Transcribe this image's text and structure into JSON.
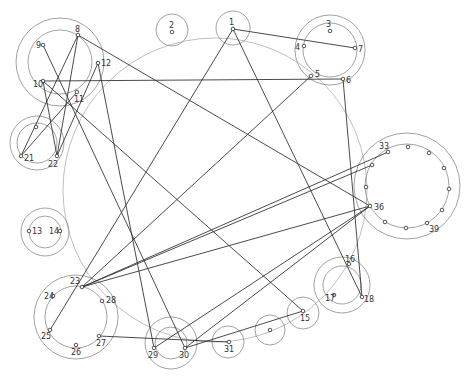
{
  "diagram": {
    "title": "",
    "big_circle": {
      "cx": 215,
      "cy": 190,
      "r": 152
    },
    "clusters": [
      {
        "id": "c-8-12",
        "cx": 60,
        "cy": 62,
        "r_outer": 44,
        "r_inner": 32
      },
      {
        "id": "c-2",
        "cx": 172,
        "cy": 30,
        "r_outer": 16,
        "r_inner": 0
      },
      {
        "id": "c-1",
        "cx": 233,
        "cy": 28,
        "r_outer": 17,
        "r_inner": 0
      },
      {
        "id": "c-3-7",
        "cx": 330,
        "cy": 50,
        "r_outer": 35,
        "r_inner": 27
      },
      {
        "id": "c-21-22",
        "cx": 37,
        "cy": 143,
        "r_outer": 27,
        "r_inner": 20
      },
      {
        "id": "c-33-44",
        "cx": 407,
        "cy": 186,
        "r_outer": 53,
        "r_inner": 42
      },
      {
        "id": "c-13-14",
        "cx": 45,
        "cy": 232,
        "r_outer": 24,
        "r_inner": 16
      },
      {
        "id": "c-16-18",
        "cx": 342,
        "cy": 285,
        "r_outer": 28,
        "r_inner": 19
      },
      {
        "id": "c-23-28",
        "cx": 76,
        "cy": 317,
        "r_outer": 42,
        "r_inner": 31
      },
      {
        "id": "c-15",
        "cx": 303,
        "cy": 313,
        "r_outer": 16,
        "r_inner": 0
      },
      {
        "id": "c-unl",
        "cx": 270,
        "cy": 330,
        "r_outer": 15,
        "r_inner": 0
      },
      {
        "id": "c-31",
        "cx": 228,
        "cy": 342,
        "r_outer": 16,
        "r_inner": 0
      },
      {
        "id": "c-29-30",
        "cx": 171,
        "cy": 343,
        "r_outer": 26,
        "r_inner": 16
      }
    ],
    "nodes": [
      {
        "id": "1",
        "x": 233,
        "y": 29,
        "label": "1",
        "lx": 229,
        "ly": 25
      },
      {
        "id": "2",
        "x": 172,
        "y": 32,
        "label": "2",
        "lx": 169,
        "ly": 28
      },
      {
        "id": "3",
        "x": 330,
        "y": 31,
        "label": "3",
        "lx": 326,
        "ly": 27
      },
      {
        "id": "4",
        "x": 304,
        "y": 46,
        "label": "4",
        "lx": 295,
        "ly": 50
      },
      {
        "id": "5",
        "x": 311,
        "y": 76,
        "label": "5",
        "lx": 315,
        "ly": 77
      },
      {
        "id": "6",
        "x": 343,
        "y": 79,
        "label": "6",
        "lx": 346,
        "ly": 83
      },
      {
        "id": "7",
        "x": 355,
        "y": 48,
        "label": "7",
        "lx": 358,
        "ly": 52
      },
      {
        "id": "8",
        "x": 78,
        "y": 35,
        "label": "8",
        "lx": 75,
        "ly": 32
      },
      {
        "id": "9",
        "x": 43,
        "y": 45,
        "label": "9",
        "lx": 36,
        "ly": 48
      },
      {
        "id": "10",
        "x": 43,
        "y": 81,
        "label": "10",
        "lx": 33,
        "ly": 87
      },
      {
        "id": "11",
        "x": 77,
        "y": 92,
        "label": "11",
        "lx": 74,
        "ly": 102
      },
      {
        "id": "12",
        "x": 98,
        "y": 63,
        "label": "12",
        "lx": 101,
        "ly": 66
      },
      {
        "id": "13",
        "x": 29,
        "y": 231,
        "label": "13",
        "lx": 32,
        "ly": 234
      },
      {
        "id": "14",
        "x": 60,
        "y": 231,
        "label": "14",
        "lx": 49,
        "ly": 234
      },
      {
        "id": "15",
        "x": 303,
        "y": 311,
        "label": "15",
        "lx": 300,
        "ly": 321
      },
      {
        "id": "16",
        "x": 349,
        "y": 264,
        "label": "16",
        "lx": 345,
        "ly": 262
      },
      {
        "id": "17",
        "x": 334,
        "y": 295,
        "label": "17",
        "lx": 325,
        "ly": 301
      },
      {
        "id": "18",
        "x": 362,
        "y": 297,
        "label": "18",
        "lx": 364,
        "ly": 302
      },
      {
        "id": "21",
        "x": 21,
        "y": 156,
        "label": "21",
        "lx": 24,
        "ly": 161
      },
      {
        "id": "22",
        "x": 57,
        "y": 156,
        "label": "22",
        "lx": 48,
        "ly": 167
      },
      {
        "id": "23",
        "x": 82,
        "y": 287,
        "label": "23",
        "lx": 70,
        "ly": 284
      },
      {
        "id": "24",
        "x": 53,
        "y": 296,
        "label": "24",
        "lx": 44,
        "ly": 299
      },
      {
        "id": "25",
        "x": 50,
        "y": 330,
        "label": "25",
        "lx": 41,
        "ly": 339
      },
      {
        "id": "26",
        "x": 76,
        "y": 345,
        "label": "26",
        "lx": 71,
        "ly": 355
      },
      {
        "id": "27",
        "x": 99,
        "y": 336,
        "label": "27",
        "lx": 96,
        "ly": 346
      },
      {
        "id": "28",
        "x": 102,
        "y": 301,
        "label": "28",
        "lx": 106,
        "ly": 303
      },
      {
        "id": "29",
        "x": 154,
        "y": 348,
        "label": "29",
        "lx": 148,
        "ly": 358
      },
      {
        "id": "30",
        "x": 185,
        "y": 348,
        "label": "30",
        "lx": 179,
        "ly": 358
      },
      {
        "id": "31",
        "x": 229,
        "y": 342,
        "label": "31",
        "lx": 224,
        "ly": 352
      },
      {
        "id": "32",
        "x": 270,
        "y": 330,
        "label": "",
        "lx": 0,
        "ly": 0
      },
      {
        "id": "33",
        "x": 388,
        "y": 152,
        "label": "33",
        "lx": 379,
        "ly": 149
      },
      {
        "id": "34",
        "x": 408,
        "y": 147,
        "label": "",
        "lx": 0,
        "ly": 0
      },
      {
        "id": "35",
        "x": 429,
        "y": 153,
        "label": "",
        "lx": 0,
        "ly": 0
      },
      {
        "id": "36",
        "x": 444,
        "y": 168,
        "label": "",
        "lx": 0,
        "ly": 0
      },
      {
        "id": "37",
        "x": 449,
        "y": 189,
        "label": "",
        "lx": 0,
        "ly": 0
      },
      {
        "id": "38",
        "x": 442,
        "y": 210,
        "label": "",
        "lx": 0,
        "ly": 0
      },
      {
        "id": "39",
        "x": 427,
        "y": 223,
        "label": "39",
        "lx": 429,
        "ly": 232
      },
      {
        "id": "40",
        "x": 406,
        "y": 228,
        "label": "",
        "lx": 0,
        "ly": 0
      },
      {
        "id": "41",
        "x": 385,
        "y": 222,
        "label": "",
        "lx": 0,
        "ly": 0
      },
      {
        "id": "42",
        "x": 370,
        "y": 206,
        "label": "36",
        "lx": 374,
        "ly": 210
      },
      {
        "id": "43",
        "x": 366,
        "y": 187,
        "label": "",
        "lx": 0,
        "ly": 0
      },
      {
        "id": "44",
        "x": 372,
        "y": 165,
        "label": "",
        "lx": 0,
        "ly": 0
      },
      {
        "id": "45",
        "x": 36,
        "y": 127,
        "label": "",
        "lx": 0,
        "ly": 0
      }
    ],
    "edges": [
      {
        "from": "1",
        "to": "7"
      },
      {
        "from": "1",
        "to": "18"
      },
      {
        "from": "1",
        "to": "25"
      },
      {
        "from": "6",
        "to": "18"
      },
      {
        "from": "10",
        "to": "6"
      },
      {
        "from": "5",
        "to": "23"
      },
      {
        "from": "8",
        "to": "21"
      },
      {
        "from": "8",
        "to": "22"
      },
      {
        "from": "8",
        "to": "42"
      },
      {
        "from": "9",
        "to": "30"
      },
      {
        "from": "10",
        "to": "15"
      },
      {
        "from": "11",
        "to": "21"
      },
      {
        "from": "12",
        "to": "22"
      },
      {
        "from": "12",
        "to": "29"
      },
      {
        "from": "10",
        "to": "22"
      },
      {
        "from": "23",
        "to": "33"
      },
      {
        "from": "23",
        "to": "42"
      },
      {
        "from": "23",
        "to": "44"
      },
      {
        "from": "29",
        "to": "42"
      },
      {
        "from": "30",
        "to": "42"
      },
      {
        "from": "30",
        "to": "15"
      },
      {
        "from": "27",
        "to": "31"
      }
    ]
  }
}
